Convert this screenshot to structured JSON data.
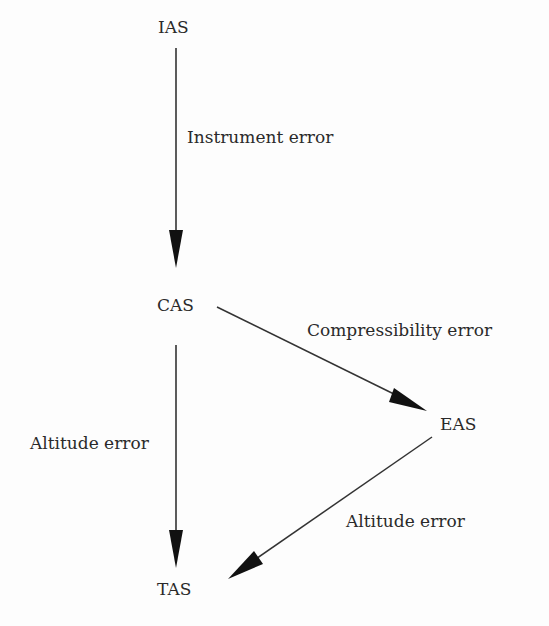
{
  "diagram": {
    "nodes": [
      {
        "id": "IAS",
        "label": "IAS"
      },
      {
        "id": "CAS",
        "label": "CAS"
      },
      {
        "id": "EAS",
        "label": "EAS"
      },
      {
        "id": "TAS",
        "label": "TAS"
      }
    ],
    "edges": [
      {
        "from": "IAS",
        "to": "CAS",
        "label": "Instrument error"
      },
      {
        "from": "CAS",
        "to": "EAS",
        "label": "Compressibility error"
      },
      {
        "from": "CAS",
        "to": "TAS",
        "label": "Altitude error"
      },
      {
        "from": "EAS",
        "to": "TAS",
        "label": "Altitude error"
      }
    ],
    "colors": {
      "line": "#333333",
      "text": "#2a2a2a",
      "background": "#fdfdfd"
    }
  }
}
